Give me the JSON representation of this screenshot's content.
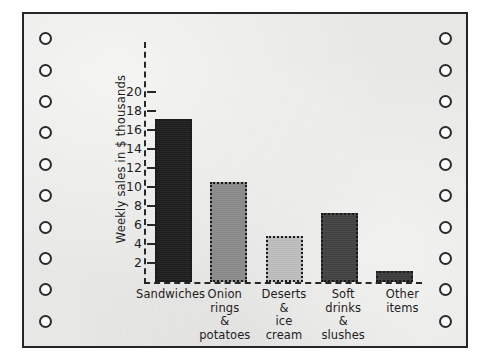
{
  "paper": {
    "kind": "tractor-feed-printout",
    "sheet_color": "#e7e7e5",
    "border_color": "#262626",
    "hole_count_left": 10,
    "hole_count_right": 10,
    "hole_fill": "#fdfdfd",
    "hole_border": "#2b2b2b"
  },
  "chart_data": {
    "type": "bar",
    "title": "",
    "subtitle": "",
    "xlabel": "",
    "ylabel": "Weekly sales in $ thousands",
    "categories": [
      "Sandwiches",
      "Onion rings & potatoes",
      "Deserts & ice cream",
      "Soft drinks & slushes",
      "Other items"
    ],
    "category_lines": [
      [
        "Sandwiches"
      ],
      [
        "Onion",
        "rings",
        "&",
        "potatoes"
      ],
      [
        "Deserts",
        "&",
        "ice",
        "cream"
      ],
      [
        "Soft",
        "drinks",
        "&",
        "slushes"
      ],
      [
        "Other",
        "items"
      ]
    ],
    "values": [
      17.2,
      10.5,
      4.8,
      7.3,
      1.2
    ],
    "bar_colors": [
      "#1f1f1f",
      "#8c8c8c",
      "#bfbfbf",
      "#434343",
      "#3d3d3d"
    ],
    "bar_edge_color": "#1a1a1a",
    "bar_edge_style": "dotted",
    "ylim": [
      0,
      21
    ],
    "yticks": [
      2,
      4,
      6,
      8,
      10,
      12,
      14,
      16,
      18,
      20
    ],
    "ytick_labels": [
      "2",
      "4",
      "6",
      "8",
      "10",
      "12",
      "14",
      "16",
      "18",
      "20"
    ],
    "grid": false,
    "axis_style": "dashed",
    "axis_color": "#272727",
    "legend": null,
    "legend_position": "none",
    "annotations": []
  }
}
